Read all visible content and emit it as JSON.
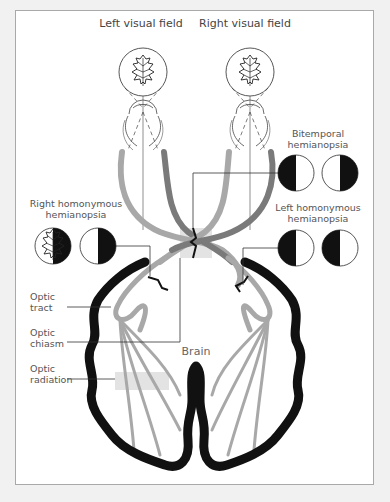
{
  "labels": {
    "left_visual_field": "Left visual field",
    "right_visual_field": "Right visual field",
    "bitemporal_line1": "Bitemporal",
    "bitemporal_line2": "hemianopsia",
    "right_homonymous_line1": "Right homonymous",
    "right_homonymous_line2": "hemianopsia",
    "left_homonymous_line1": "Left homonymous",
    "left_homonymous_line2": "hemianopsia",
    "optic_tract_line1": "Optic",
    "optic_tract_line2": "tract",
    "optic_chiasm_line1": "Optic",
    "optic_chiasm_line2": "chiasm",
    "optic_radiation_line1": "Optic",
    "optic_radiation_line2": "radiation",
    "brain": "Brain"
  },
  "colors": {
    "background": "#f1f1f1",
    "frame": "#ffffff",
    "frame_border": "#a9a9a9",
    "nerve_light": "#a8a8a8",
    "nerve_dark": "#7a7a7a",
    "brain_outline": "#111111",
    "highlight_box": "#e3e3e3",
    "leader_line": "#333333"
  },
  "visual_field_defects": [
    {
      "name": "right-homonymous",
      "fields": [
        "left-lit",
        "left-lit"
      ]
    },
    {
      "name": "bitemporal",
      "fields": [
        "right-lit",
        "left-lit"
      ]
    },
    {
      "name": "left-homonymous",
      "fields": [
        "right-lit",
        "right-lit"
      ]
    }
  ],
  "icons": [
    "oak-leaf-icon",
    "eye-icon",
    "lesion-mark-icon"
  ]
}
